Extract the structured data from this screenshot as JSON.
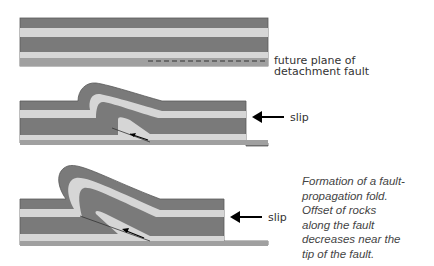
{
  "diagram": {
    "colors": {
      "dark_layer": "#7a7a7a",
      "light_layer": "#d6d6d6",
      "base_layer": "#a0a0a0",
      "outline": "#5a5a5a",
      "arrow": "#000000"
    },
    "panels": [
      {
        "name": "undeformed",
        "labels": [
          "future plane of",
          "detachment fault"
        ]
      },
      {
        "name": "early-fold",
        "labels": [
          "slip"
        ]
      },
      {
        "name": "late-fold",
        "labels": [
          "slip"
        ]
      }
    ],
    "caption": "Formation of a fault-\npropagation fold.\nOffset of rocks\nalong the fault\ndecreases near the\ntip of the fault."
  }
}
